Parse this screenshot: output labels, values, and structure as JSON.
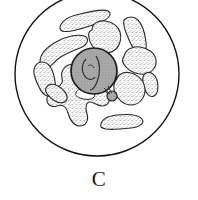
{
  "figure": {
    "panel_label": "C",
    "caption_label": "C",
    "colors": {
      "background": "#ffffff",
      "outline": "#111111",
      "nucleus_fill": "#a9a9a9",
      "nucleus_outline": "#1a1a1a",
      "body_fill": "#ffffff",
      "body_outline": "#2a2a2a",
      "stipple": "#3a3a3a",
      "label_color": "#1a1a1a"
    },
    "cell_membrane": {
      "name": "cell-outline",
      "shape": "circle",
      "cx": 97,
      "cy": 74,
      "r": 82,
      "stroke_width": 1.4
    },
    "nucleus": {
      "name": "nucleus",
      "shape": "circle",
      "cx": 94,
      "cy": 71,
      "r": 23,
      "stroke_width": 1.6,
      "internal_marks": 3
    },
    "nucleolus": {
      "name": "nucleolus",
      "cx": 112,
      "cy": 96,
      "r": 5
    },
    "bodies": [
      {
        "id": "body-1",
        "label": "elongated-body-top",
        "cx": 83,
        "cy": 18,
        "angle": -18,
        "rx": 26,
        "ry": 8
      },
      {
        "id": "body-2",
        "label": "curved-body-upper-left",
        "cx": 62,
        "cy": 48,
        "angle": 28,
        "rx": 26,
        "ry": 9
      },
      {
        "id": "body-3",
        "label": "lobed-body-top-center",
        "cx": 103,
        "cy": 40,
        "angle": 0,
        "rx": 18,
        "ry": 15
      },
      {
        "id": "body-4",
        "label": "elongated-body-upper-right",
        "cx": 133,
        "cy": 33,
        "angle": 58,
        "rx": 20,
        "ry": 8
      },
      {
        "id": "body-5",
        "label": "lobed-body-right",
        "cx": 138,
        "cy": 60,
        "angle": -12,
        "rx": 18,
        "ry": 13
      },
      {
        "id": "body-6",
        "label": "small-body-far-right",
        "cx": 152,
        "cy": 80,
        "angle": 62,
        "rx": 13,
        "ry": 6
      },
      {
        "id": "body-7",
        "label": "lobed-body-lower-right",
        "cx": 128,
        "cy": 92,
        "angle": 18,
        "rx": 17,
        "ry": 15
      },
      {
        "id": "body-8",
        "label": "worm-body-bottom-right",
        "cx": 122,
        "cy": 121,
        "angle": -14,
        "rx": 21,
        "ry": 7
      },
      {
        "id": "body-9",
        "label": "large-lobed-body-bottom",
        "cx": 80,
        "cy": 100,
        "angle": 0,
        "rx": 30,
        "ry": 24
      },
      {
        "id": "body-10",
        "label": "curved-body-left",
        "cx": 48,
        "cy": 70,
        "angle": 68,
        "rx": 18,
        "ry": 8
      },
      {
        "id": "body-11",
        "label": "body-left-lower",
        "cx": 57,
        "cy": 84,
        "angle": 40,
        "rx": 14,
        "ry": 9
      },
      {
        "id": "body-12",
        "label": "vacuole-bottom-center",
        "cx": 85,
        "cy": 96,
        "angle": 0,
        "rx": 9,
        "ry": 5
      }
    ]
  }
}
